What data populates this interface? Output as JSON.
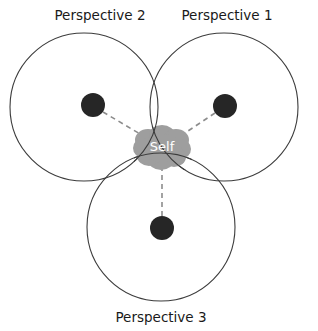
{
  "diagram": {
    "title_labels": [
      {
        "id": "perspective-2",
        "text": "Perspective 2",
        "x": 100,
        "y": 16
      },
      {
        "id": "perspective-1",
        "text": "Perspective 1",
        "x": 227,
        "y": 16
      },
      {
        "id": "perspective-3",
        "text": "Perspective 3",
        "x": 161,
        "y": 318
      }
    ],
    "center_label": {
      "text": "Self",
      "x": 162,
      "y": 147
    },
    "colors": {
      "background": "#ffffff",
      "circle_stroke": "#3c3c3c",
      "node_fill": "#262626",
      "blob_fill": "#9e9e9e",
      "dashed_line": "#8c8c8c",
      "label_text": "#1a1a1a",
      "center_text": "#ffffff"
    },
    "circles": [
      {
        "id": "circle-perspective-2",
        "cx": 84,
        "cy": 107,
        "r": 74
      },
      {
        "id": "circle-perspective-1",
        "cx": 224,
        "cy": 107,
        "r": 74
      },
      {
        "id": "circle-perspective-3",
        "cx": 161,
        "cy": 227,
        "r": 74
      }
    ],
    "nodes": [
      {
        "id": "node-perspective-2",
        "cx": 93,
        "cy": 105,
        "r": 12
      },
      {
        "id": "node-perspective-1",
        "cx": 225,
        "cy": 106,
        "r": 12
      },
      {
        "id": "node-perspective-3",
        "cx": 162,
        "cy": 228,
        "r": 12
      }
    ],
    "connectors": [
      {
        "id": "connector-perspective-2",
        "x1": 103,
        "y1": 112,
        "x2": 157,
        "y2": 144
      },
      {
        "id": "connector-perspective-1",
        "x1": 215,
        "y1": 113,
        "x2": 170,
        "y2": 143
      },
      {
        "id": "connector-perspective-3",
        "x1": 162,
        "y1": 216,
        "x2": 162,
        "y2": 158
      }
    ],
    "blob": {
      "id": "self-blob",
      "cx": 162,
      "cy": 147,
      "lobes": [
        {
          "cx": 148,
          "cy": 140,
          "rx": 13,
          "ry": 11
        },
        {
          "cx": 162,
          "cy": 135,
          "rx": 13,
          "ry": 10
        },
        {
          "cx": 176,
          "cy": 140,
          "rx": 13,
          "ry": 11
        },
        {
          "cx": 181,
          "cy": 149,
          "rx": 10,
          "ry": 10
        },
        {
          "cx": 174,
          "cy": 157,
          "rx": 12,
          "ry": 10
        },
        {
          "cx": 161,
          "cy": 160,
          "rx": 13,
          "ry": 10
        },
        {
          "cx": 149,
          "cy": 156,
          "rx": 12,
          "ry": 10
        },
        {
          "cx": 143,
          "cy": 148,
          "rx": 10,
          "ry": 10
        },
        {
          "cx": 162,
          "cy": 148,
          "rx": 20,
          "ry": 14
        }
      ]
    }
  }
}
